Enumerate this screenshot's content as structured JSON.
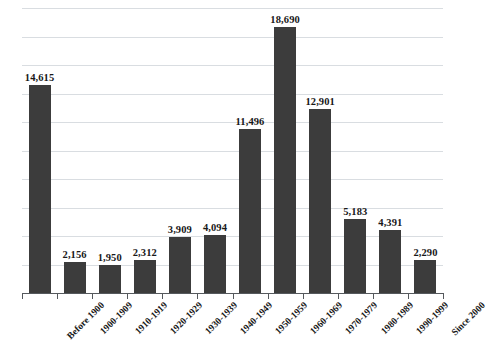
{
  "chart_data": {
    "type": "bar",
    "title": "",
    "subtitle": "",
    "xlabel": "",
    "ylabel": "",
    "categories": [
      "Before 1900",
      "1900-1909",
      "1910-1919",
      "1920-1929",
      "1930-1939",
      "1940-1949",
      "1950-1959",
      "1960-1969",
      "1970-1979",
      "1980-1989",
      "1990-1999",
      "Since 2000"
    ],
    "values": [
      14615,
      2156,
      1950,
      2312,
      3909,
      4094,
      11496,
      18690,
      12901,
      5183,
      4391,
      2290
    ],
    "value_labels": [
      "14,615",
      "2,156",
      "1,950",
      "2,312",
      "3,909",
      "4,094",
      "11,496",
      "18,690",
      "12,901",
      "5,183",
      "4,391",
      "2,290"
    ],
    "ylim": [
      0,
      20000
    ],
    "grid": true,
    "gridline_interval": 2000,
    "gridline_count": 10,
    "y_tick_labels_visible": false,
    "legend": null,
    "legend_position": "none",
    "bar_color": "#3c3c3c",
    "gridline_color": "#d9dde1",
    "axis_color": "#55595d",
    "label_color": "#181818",
    "background_color": "#ffffff",
    "data_labels_shown": true,
    "category_label_rotation": -45
  }
}
